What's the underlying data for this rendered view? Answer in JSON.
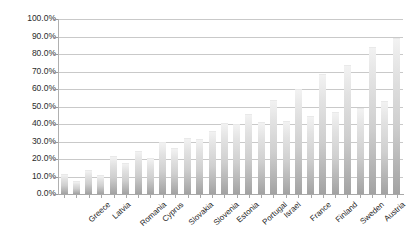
{
  "chart_data": {
    "type": "bar",
    "title": "",
    "subtitle": "",
    "xlabel": "",
    "ylabel": "",
    "ylim": [
      0,
      100
    ],
    "ytick_step": 10,
    "grid": true,
    "legend": "none",
    "value_format": "percent",
    "ytick_labels": [
      "100.0%",
      "90.0%",
      "80.0%",
      "70.0%",
      "60.0%",
      "50.0%",
      "40.0%",
      "30.0%",
      "20.0%",
      "10.0%",
      "0.0%"
    ],
    "ytick_values": [
      100,
      90,
      80,
      70,
      60,
      50,
      40,
      30,
      20,
      10,
      0
    ],
    "categories": [
      "Greece",
      "Latvia",
      "Romania",
      "Cyprus",
      "Slovakia",
      "Slovenia",
      "Estonia",
      "Portugal",
      "Israel",
      "France",
      "Finland",
      "Sweden",
      "Austria",
      "Denmark"
    ],
    "series": [
      {
        "name": "Series 1",
        "values": [
          11.5,
          13.5,
          21.5,
          24.5,
          30.0,
          32.0,
          36.0,
          40.0,
          41.0,
          41.5,
          44.5,
          47.0,
          49.0,
          53.0
        ]
      },
      {
        "name": "Series 2",
        "values": [
          7.5,
          11.0,
          17.5,
          20.5,
          26.5,
          31.5,
          40.5,
          46.0,
          53.5,
          60.0,
          68.5,
          74.0,
          84.0,
          89.0
        ]
      }
    ],
    "bar_color": "#cfcfcf",
    "gridline_color": "#c9c9c9",
    "axis_color": "#a8a8a8",
    "text_color": "#1f1f1f"
  }
}
